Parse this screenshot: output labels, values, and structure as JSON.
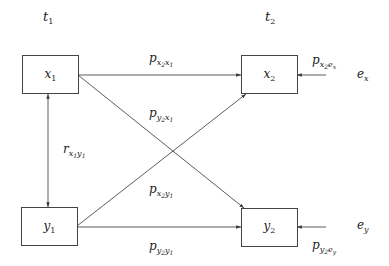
{
  "diagram": {
    "type": "cross-lagged panel path diagram",
    "time_labels": {
      "t1": {
        "base": "t",
        "sub": "1"
      },
      "t2": {
        "base": "t",
        "sub": "2"
      }
    },
    "nodes": {
      "x1": {
        "base": "x",
        "sub": "1"
      },
      "x2": {
        "base": "x",
        "sub": "2"
      },
      "y1": {
        "base": "y",
        "sub": "1"
      },
      "y2": {
        "base": "y",
        "sub": "2"
      },
      "ex": {
        "base": "e",
        "sub": "x"
      },
      "ey": {
        "base": "e",
        "sub": "y"
      }
    },
    "paths": {
      "p_x2x1": {
        "base": "p",
        "s1": "x",
        "s1s": "2",
        "s2": "x",
        "s2s": "1"
      },
      "p_y2x1": {
        "base": "p",
        "s1": "y",
        "s1s": "2",
        "s2": "x",
        "s2s": "1"
      },
      "r_x1y1": {
        "base": "r",
        "s1": "x",
        "s1s": "1",
        "s2": "y",
        "s2s": "1"
      },
      "p_x2y1": {
        "base": "p",
        "s1": "x",
        "s1s": "2",
        "s2": "y",
        "s2s": "1"
      },
      "p_y2y1": {
        "base": "p",
        "s1": "y",
        "s1s": "2",
        "s2": "y",
        "s2s": "1"
      },
      "p_x2ex": {
        "base": "p",
        "s1": "x",
        "s1s": "2",
        "s2": "e",
        "s2s": "x"
      },
      "p_y2ey": {
        "base": "p",
        "s1": "y",
        "s1s": "2",
        "s2": "e",
        "s2s": "y"
      }
    },
    "edges": [
      {
        "from": "x1",
        "to": "x2",
        "label": "p_x2x1"
      },
      {
        "from": "x1",
        "to": "y2",
        "label": "p_y2x1"
      },
      {
        "from": "y1",
        "to": "x2",
        "label": "p_x2y1"
      },
      {
        "from": "y1",
        "to": "y2",
        "label": "p_y2y1"
      },
      {
        "from": "x1",
        "to": "y1",
        "label": "r_x1y1",
        "bidirectional": true
      },
      {
        "from": "ex",
        "to": "x2",
        "label": "p_x2ex"
      },
      {
        "from": "ey",
        "to": "y2",
        "label": "p_y2ey"
      }
    ],
    "colors": {
      "line": "#333333",
      "text": "#222222",
      "background": "#ffffff"
    }
  }
}
